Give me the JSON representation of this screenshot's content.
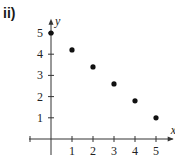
{
  "figure": {
    "part_label": "ii)"
  },
  "chart_data": {
    "type": "scatter",
    "title": "",
    "xlabel": "x",
    "ylabel": "y",
    "x_ticks": [
      1,
      2,
      3,
      4,
      5
    ],
    "y_ticks": [
      1,
      2,
      3,
      4,
      5
    ],
    "xlim": [
      -1,
      5.7
    ],
    "ylim": [
      -0.6,
      6
    ],
    "grid": false,
    "legend": null,
    "series": [
      {
        "name": "points",
        "x": [
          0,
          1,
          2,
          3,
          4,
          5
        ],
        "y": [
          5,
          4.2,
          3.4,
          2.6,
          1.8,
          1.0
        ]
      }
    ],
    "colors": {
      "axis": "#333333",
      "point": "#111111"
    }
  }
}
